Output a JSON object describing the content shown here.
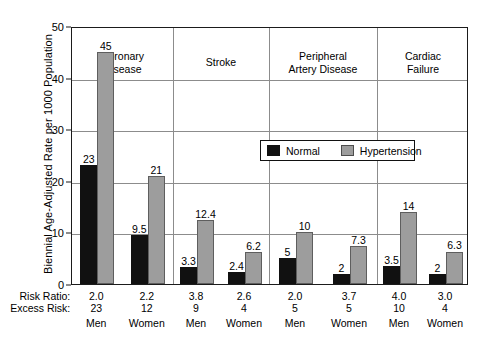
{
  "chart_data": {
    "type": "bar",
    "title": "",
    "xlabel": "",
    "ylabel": "Biennial Age-Adjusted Rate per 1000 Population",
    "ylim": [
      0,
      50
    ],
    "yticks": [
      0,
      10,
      20,
      30,
      40,
      50
    ],
    "grid": true,
    "legend_position": "upper center inside plot",
    "legend": [
      "Normal",
      "Hypertension"
    ],
    "series": [
      {
        "name": "Normal",
        "color": "#111111",
        "values": [
          23,
          9.5,
          3.3,
          2.4,
          5,
          2,
          3.5,
          2
        ]
      },
      {
        "name": "Hypertension",
        "color": "#9d9d9d",
        "values": [
          45,
          21,
          12.4,
          6.2,
          10,
          7.3,
          14,
          6.3
        ]
      }
    ],
    "categories": [
      "Men",
      "Women",
      "Men",
      "Women",
      "Men",
      "Women",
      "Men",
      "Women"
    ],
    "groups": [
      {
        "label": "Coronary\nDisease",
        "label_line1": "Coronary",
        "label_line2": "Disease",
        "subgroups": [
          {
            "sex": "Men",
            "normal": 23,
            "hypertension": 45,
            "risk_ratio": "2.0",
            "excess_risk": "23"
          },
          {
            "sex": "Women",
            "normal": 9.5,
            "hypertension": 21,
            "risk_ratio": "2.2",
            "excess_risk": "12"
          }
        ]
      },
      {
        "label": "Stroke",
        "label_line1": "Stroke",
        "label_line2": "",
        "subgroups": [
          {
            "sex": "Men",
            "normal": 3.3,
            "hypertension": 12.4,
            "risk_ratio": "3.8",
            "excess_risk": "9"
          },
          {
            "sex": "Women",
            "normal": 2.4,
            "hypertension": 6.2,
            "risk_ratio": "2.6",
            "excess_risk": "4"
          }
        ]
      },
      {
        "label": "Peripheral\nArtery Disease",
        "label_line1": "Peripheral",
        "label_line2": "Artery Disease",
        "subgroups": [
          {
            "sex": "Men",
            "normal": 5,
            "hypertension": 10,
            "risk_ratio": "2.0",
            "excess_risk": "5"
          },
          {
            "sex": "Women",
            "normal": 2,
            "hypertension": 7.3,
            "risk_ratio": "3.7",
            "excess_risk": "5"
          }
        ]
      },
      {
        "label": "Cardiac\nFailure",
        "label_line1": "Cardiac",
        "label_line2": "Failure",
        "subgroups": [
          {
            "sex": "Men",
            "normal": 3.5,
            "hypertension": 14,
            "risk_ratio": "4.0",
            "excess_risk": "10"
          },
          {
            "sex": "Women",
            "normal": 2,
            "hypertension": 6.3,
            "risk_ratio": "3.0",
            "excess_risk": "4"
          }
        ]
      }
    ],
    "bar_value_labels": [
      "23",
      "45",
      "9.5",
      "21",
      "3.3",
      "12.4",
      "2.4",
      "6.2",
      "5",
      "10",
      "2",
      "7.3",
      "3.5",
      "14",
      "2",
      "6.3"
    ],
    "annotation_rows": [
      {
        "label": "Risk Ratio:",
        "values": [
          "2.0",
          "2.2",
          "3.8",
          "2.6",
          "2.0",
          "3.7",
          "4.0",
          "3.0"
        ]
      },
      {
        "label": "Excess Risk:",
        "values": [
          "23",
          "12",
          "9",
          "4",
          "5",
          "5",
          "10",
          "4"
        ]
      },
      {
        "label": "",
        "values": [
          "Men",
          "Women",
          "Men",
          "Women",
          "Men",
          "Women",
          "Men",
          "Women"
        ]
      }
    ]
  }
}
